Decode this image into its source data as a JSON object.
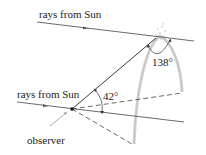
{
  "diagram": {
    "labels": {
      "top_ray": "rays from Sun",
      "bottom_ray": "rays from Sun",
      "angle_small": "42°",
      "angle_large": "138°",
      "observer": "observer"
    },
    "colors": {
      "line": "#333333",
      "rainbow_arc": "#c8c8c8",
      "text": "#222222"
    }
  }
}
